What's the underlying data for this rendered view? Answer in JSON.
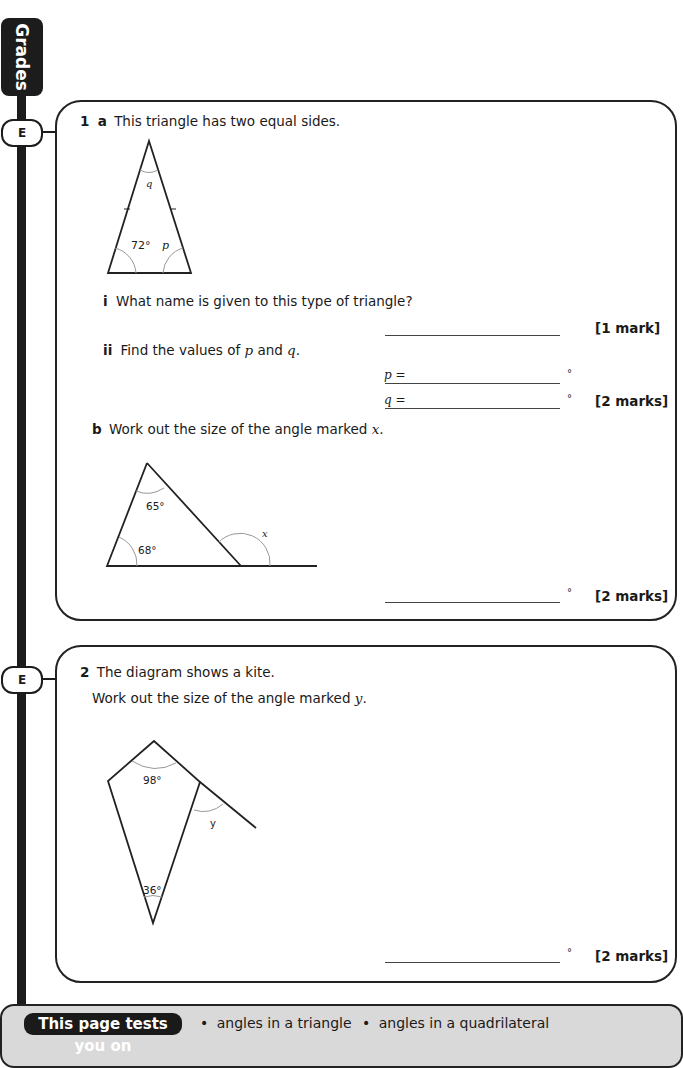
{
  "sidebar": {
    "title": "Grades",
    "badges": [
      {
        "label": "E",
        "question": 1
      },
      {
        "label": "E",
        "question": 2
      }
    ]
  },
  "question1": {
    "number": "1",
    "part_a": {
      "label": "a",
      "text": "This triangle has two equal sides.",
      "diagram": {
        "angle_labels": {
          "apex": "q",
          "bottom_left": "72°",
          "bottom_right": "p"
        }
      },
      "sub_i": {
        "label": "i",
        "text": "What name is given to this type of triangle?",
        "marks": "[1 mark]"
      },
      "sub_ii": {
        "label": "ii",
        "text_before": "Find the values of ",
        "var1": "p",
        "text_mid": " and ",
        "var2": "q",
        "text_after": ".",
        "answers": [
          {
            "prefix": "p =",
            "unit": "°"
          },
          {
            "prefix": "q =",
            "unit": "°"
          }
        ],
        "marks": "[2 marks]"
      }
    },
    "part_b": {
      "label": "b",
      "text": "Work out the size of the angle marked ",
      "var": "x",
      "text_after": ".",
      "diagram": {
        "angle_labels": {
          "top": "65°",
          "bottom_left": "68°",
          "exterior": "x"
        }
      },
      "answer_unit": "°",
      "marks": "[2 marks]"
    }
  },
  "question2": {
    "number": "2",
    "text": "The diagram shows a kite.",
    "text2": "Work out the size of the angle marked ",
    "var": "y",
    "text2_after": ".",
    "diagram": {
      "angle_labels": {
        "top": "98°",
        "bottom": "36°",
        "exterior": "y"
      }
    },
    "answer_unit": "°",
    "marks": "[2 marks]"
  },
  "footer": {
    "pill": "This page tests you on",
    "topics": [
      "angles in a triangle",
      "angles in a quadrilateral"
    ],
    "bullet": "•"
  }
}
